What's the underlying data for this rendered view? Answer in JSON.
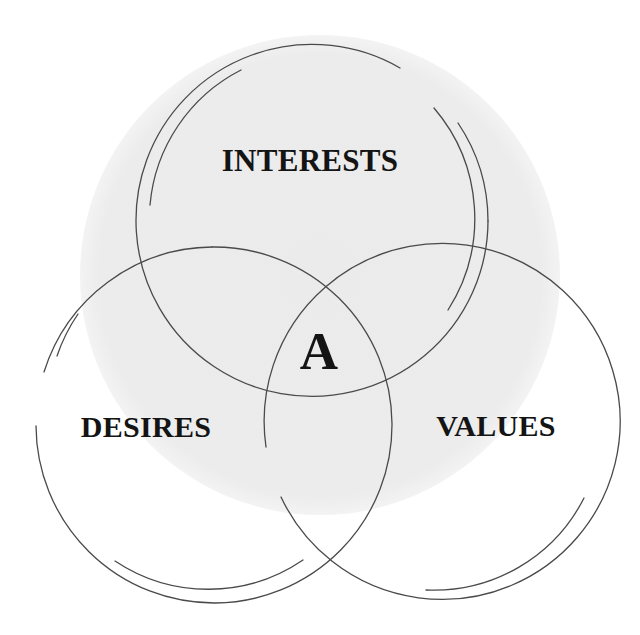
{
  "diagram": {
    "type": "venn",
    "colors": {
      "background_disc": "#ececec",
      "stroke": "#4a4a4a",
      "text": "#141414",
      "page": "#ffffff"
    },
    "circles": [
      {
        "id": "interests",
        "label": "INTERESTS",
        "position": "top"
      },
      {
        "id": "desires",
        "label": "DESIRES",
        "position": "bottom-left"
      },
      {
        "id": "values",
        "label": "VALUES",
        "position": "bottom-right"
      }
    ],
    "center_label": "A"
  }
}
